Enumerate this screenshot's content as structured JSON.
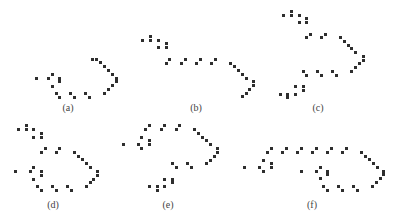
{
  "figure": {
    "dot_color": "#2e2e2e",
    "label_color": "#444444",
    "panels": [
      {
        "id": "a",
        "label": "(a)",
        "label_pos": [
          68,
          107
        ],
        "dots": [
          [
            36.7,
            78.3
          ],
          [
            48.3,
            78.3
          ],
          [
            52.3,
            74.3
          ],
          [
            59.7,
            78.3
          ],
          [
            59.7,
            81.7
          ],
          [
            52,
            86
          ],
          [
            56,
            93.3
          ],
          [
            59.7,
            97.3
          ],
          [
            70.3,
            93.3
          ],
          [
            74,
            97.3
          ],
          [
            85.3,
            93.3
          ],
          [
            89.3,
            97.3
          ],
          [
            104.3,
            93.3
          ],
          [
            108,
            89.3
          ],
          [
            112,
            85.7
          ],
          [
            116,
            81.7
          ],
          [
            116,
            78
          ],
          [
            112,
            74.3
          ],
          [
            108,
            70.7
          ],
          [
            104,
            66.7
          ],
          [
            100.3,
            62.7
          ],
          [
            96.3,
            59.3
          ],
          [
            92.7,
            59
          ]
        ]
      },
      {
        "id": "b",
        "label": "(b)",
        "label_pos": [
          196,
          107
        ],
        "dots": [
          [
            142.7,
            40
          ],
          [
            150.3,
            36
          ],
          [
            150.3,
            40
          ],
          [
            158,
            40
          ],
          [
            158,
            47.3
          ],
          [
            166,
            43.7
          ],
          [
            166,
            47.3
          ],
          [
            166,
            63
          ],
          [
            169.7,
            59
          ],
          [
            181.3,
            63
          ],
          [
            185,
            59
          ],
          [
            196,
            63
          ],
          [
            200,
            59
          ],
          [
            211.3,
            63
          ],
          [
            215,
            59
          ],
          [
            230.7,
            63
          ],
          [
            234.7,
            66.7
          ],
          [
            238.3,
            70.3
          ],
          [
            242.3,
            74
          ],
          [
            246,
            78
          ],
          [
            253.7,
            81.7
          ],
          [
            253.7,
            85.7
          ],
          [
            249.7,
            89.3
          ],
          [
            246,
            93.3
          ],
          [
            242,
            96.7
          ]
        ]
      },
      {
        "id": "c",
        "label": "(c)",
        "label_pos": [
          318,
          107
        ],
        "dots": [
          [
            283.7,
            15
          ],
          [
            291.3,
            11
          ],
          [
            291.3,
            15
          ],
          [
            299,
            15
          ],
          [
            299,
            22.3
          ],
          [
            306.3,
            18.7
          ],
          [
            306.3,
            22.3
          ],
          [
            306.3,
            37.7
          ],
          [
            310,
            34
          ],
          [
            321.3,
            37.7
          ],
          [
            325,
            34
          ],
          [
            340,
            37.7
          ],
          [
            344,
            41.3
          ],
          [
            348,
            45
          ],
          [
            351.7,
            48.7
          ],
          [
            355.3,
            52.3
          ],
          [
            363,
            56
          ],
          [
            363,
            60
          ],
          [
            359,
            63.7
          ],
          [
            355.3,
            67.3
          ],
          [
            351.7,
            71
          ],
          [
            303,
            71
          ],
          [
            306.7,
            75
          ],
          [
            317.7,
            71
          ],
          [
            321.3,
            75
          ],
          [
            332.3,
            71
          ],
          [
            336.3,
            75
          ],
          [
            295.3,
            86.3
          ],
          [
            303,
            86.3
          ],
          [
            303,
            90.3
          ],
          [
            295.3,
            94
          ],
          [
            287.7,
            94
          ],
          [
            287.7,
            97.7
          ],
          [
            280,
            94
          ]
        ]
      },
      {
        "id": "d",
        "label": "(d)",
        "label_pos": [
          53,
          204
        ],
        "dots": [
          [
            18.3,
            129.7
          ],
          [
            26,
            125.7
          ],
          [
            26,
            129.7
          ],
          [
            33.7,
            129.7
          ],
          [
            33.7,
            137.3
          ],
          [
            41,
            133.3
          ],
          [
            41,
            137.3
          ],
          [
            41,
            152.7
          ],
          [
            45,
            148.7
          ],
          [
            56,
            152.7
          ],
          [
            59.7,
            148.7
          ],
          [
            74.3,
            152.3
          ],
          [
            78.3,
            156
          ],
          [
            82.3,
            159.7
          ],
          [
            86,
            163.3
          ],
          [
            90,
            167.3
          ],
          [
            97.3,
            171.3
          ],
          [
            97.3,
            175
          ],
          [
            93.7,
            179
          ],
          [
            90,
            182.7
          ],
          [
            86,
            186.3
          ],
          [
            15,
            171.3
          ],
          [
            30,
            171.3
          ],
          [
            33.7,
            167.7
          ],
          [
            41,
            171.3
          ],
          [
            41,
            175
          ],
          [
            33.7,
            179
          ],
          [
            37.3,
            186.3
          ],
          [
            41,
            190.3
          ],
          [
            52.3,
            186.3
          ],
          [
            56,
            190.3
          ],
          [
            67.3,
            186.3
          ],
          [
            71,
            190.3
          ]
        ]
      },
      {
        "id": "e",
        "label": "(e)",
        "label_pos": [
          168,
          204
        ],
        "dots": [
          [
            145.7,
            129.7
          ],
          [
            149.3,
            125.7
          ],
          [
            161,
            129.7
          ],
          [
            164.7,
            125.7
          ],
          [
            176,
            129.7
          ],
          [
            179.7,
            125.7
          ],
          [
            194.3,
            129.7
          ],
          [
            198.3,
            133.3
          ],
          [
            202.3,
            137
          ],
          [
            206.3,
            140.7
          ],
          [
            210.3,
            144.7
          ],
          [
            217.7,
            148.3
          ],
          [
            217.7,
            152.3
          ],
          [
            214,
            156
          ],
          [
            210.3,
            160
          ],
          [
            206.3,
            163.7
          ],
          [
            123.3,
            144.7
          ],
          [
            138,
            144.7
          ],
          [
            141.7,
            137
          ],
          [
            141.7,
            148.3
          ],
          [
            149.3,
            140.7
          ],
          [
            149.3,
            144.7
          ],
          [
            172.3,
            163.7
          ],
          [
            176.3,
            167.3
          ],
          [
            187.3,
            163.7
          ],
          [
            191.3,
            167.3
          ],
          [
            164.7,
            179
          ],
          [
            172.3,
            179
          ],
          [
            172.3,
            182.7
          ],
          [
            164.7,
            186.3
          ],
          [
            157,
            186.3
          ],
          [
            157,
            190.3
          ],
          [
            149.3,
            186.3
          ]
        ]
      },
      {
        "id": "f",
        "label": "(f)",
        "label_pos": [
          312,
          204
        ],
        "dots": [
          [
            267,
            152.3
          ],
          [
            271,
            148.3
          ],
          [
            282.3,
            152.3
          ],
          [
            286.3,
            148.3
          ],
          [
            297.7,
            152.3
          ],
          [
            301.7,
            148.3
          ],
          [
            312.7,
            152.3
          ],
          [
            316.7,
            148.3
          ],
          [
            327.7,
            152.3
          ],
          [
            331.7,
            148.3
          ],
          [
            342.7,
            152.3
          ],
          [
            346.7,
            148.3
          ],
          [
            361.7,
            152.3
          ],
          [
            365.3,
            156
          ],
          [
            369.3,
            159.7
          ],
          [
            373.3,
            163.7
          ],
          [
            377,
            167.3
          ],
          [
            383.3,
            171.3
          ],
          [
            383.3,
            174.7
          ],
          [
            380,
            178.7
          ],
          [
            376.3,
            182.3
          ],
          [
            372.7,
            186
          ],
          [
            244.3,
            167.3
          ],
          [
            259.3,
            167.3
          ],
          [
            263,
            160
          ],
          [
            263,
            171.3
          ],
          [
            271,
            163.7
          ],
          [
            271,
            167.3
          ],
          [
            301.3,
            171.3
          ],
          [
            316.3,
            171.3
          ],
          [
            320,
            167.3
          ],
          [
            327.3,
            171.3
          ],
          [
            327.3,
            174.7
          ],
          [
            320,
            178.7
          ],
          [
            323.7,
            186
          ],
          [
            327.3,
            190
          ],
          [
            338.7,
            186
          ],
          [
            342.7,
            190
          ],
          [
            353.7,
            186
          ],
          [
            357.7,
            190
          ]
        ]
      }
    ]
  }
}
